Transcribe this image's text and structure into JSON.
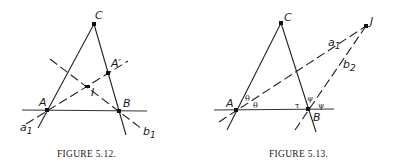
{
  "figures": [
    {
      "caption": "FIGURE 5.12.",
      "points": {
        "C": {
          "label": "C",
          "x": 94,
          "y": 24
        },
        "A": {
          "label": "A",
          "x": 47,
          "y": 110
        },
        "B": {
          "label": "B",
          "x": 119,
          "y": 111
        },
        "A_prime": {
          "label": "A′",
          "x": 108,
          "y": 73
        },
        "I": {
          "label": "I",
          "x": 88,
          "y": 86
        }
      },
      "lines": {
        "a1": {
          "label": "a",
          "subscript": "1"
        },
        "b1": {
          "label": "b",
          "subscript": "1"
        }
      }
    },
    {
      "caption": "FIGURE 5.13.",
      "points": {
        "C": {
          "label": "C",
          "x": 281,
          "y": 23
        },
        "A": {
          "label": "A",
          "x": 236,
          "y": 110
        },
        "B": {
          "label": "B",
          "x": 308,
          "y": 109
        },
        "J": {
          "label": "J",
          "x": 366,
          "y": 26
        }
      },
      "lines": {
        "a1": {
          "label": "a",
          "subscript": "1"
        },
        "b2": {
          "label": "b",
          "subscript": "2"
        }
      },
      "angles": {
        "theta_upper": "θ",
        "theta_lower": "θ",
        "tau": "τ",
        "psi_left": "ψ",
        "psi_right": "ψ"
      }
    }
  ]
}
